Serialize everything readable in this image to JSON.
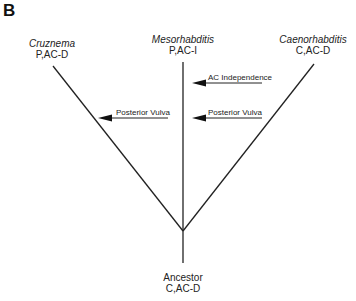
{
  "panel": {
    "letter": "B"
  },
  "taxa": {
    "left": {
      "name": "Cruznema",
      "state": "P,AC-D"
    },
    "middle": {
      "name": "Mesorhabditis",
      "state": "P,AC-I"
    },
    "right": {
      "name": "Caenorhabditis",
      "state": "C,AC-D"
    },
    "root": {
      "name": "Ancestor",
      "state": "C,AC-D"
    }
  },
  "events": [
    {
      "label": "Posterior Vulva",
      "branch": "Cruznema"
    },
    {
      "label": "AC Independence",
      "branch": "Mesorhabditis"
    },
    {
      "label": "Posterior Vulva",
      "branch": "Mesorhabditis"
    }
  ],
  "colors": {
    "line": "#222222",
    "text": "#222222",
    "background": "#ffffff"
  }
}
